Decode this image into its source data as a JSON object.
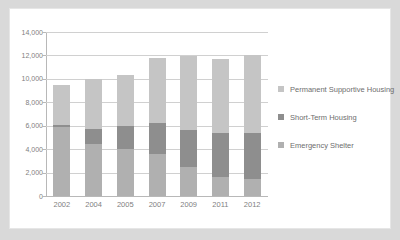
{
  "chart_data": {
    "type": "bar",
    "stacked": true,
    "title": "",
    "subtitle": "",
    "xlabel": "",
    "ylabel": "",
    "categories": [
      "2002",
      "2004",
      "2005",
      "2007",
      "2009",
      "2011",
      "2012"
    ],
    "series": [
      {
        "name": "Emergency Shelter",
        "color": "#b0b0b0",
        "values": [
          5900,
          4400,
          4000,
          3600,
          2500,
          1650,
          1450
        ]
      },
      {
        "name": "Short-Term Housing",
        "color": "#8e8e8e",
        "values": [
          200,
          1300,
          1950,
          2650,
          3150,
          3750,
          3950
        ]
      },
      {
        "name": "Permanent Supportive Housing",
        "color": "#c5c5c5",
        "values": [
          3400,
          4300,
          4400,
          5500,
          6300,
          6300,
          6600
        ]
      }
    ],
    "totals": [
      9500,
      10000,
      10350,
      11750,
      11950,
      11700,
      12000
    ],
    "ylim": [
      0,
      14000
    ],
    "ytick_values": [
      0,
      2000,
      4000,
      6000,
      8000,
      10000,
      12000,
      14000
    ],
    "ytick_labels": [
      "0",
      "2,000",
      "4,000",
      "6,000",
      "8,000",
      "10,000",
      "12,000",
      "14,000"
    ],
    "grid": true,
    "legend_position": "right",
    "legend_entries": [
      "Permanent Supportive Housing",
      "Short-Term Housing",
      "Emergency Shelter"
    ],
    "colors": {
      "permanent_supportive_housing": "#c5c5c5",
      "short_term_housing": "#8e8e8e",
      "emergency_shelter": "#b0b0b0",
      "gridline": "#d0d0d0",
      "axis": "#b8b8b8",
      "tick_text": "#808080",
      "legend_text": "#6e6e6e",
      "panel_background": "#ffffff",
      "page_background": "#d9d9d9"
    }
  }
}
